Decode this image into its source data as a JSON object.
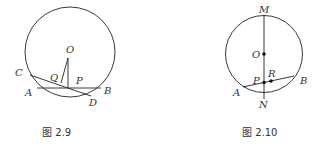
{
  "figures": [
    {
      "caption": "图 2.9",
      "labels": {
        "O": "O",
        "Q": "Q",
        "P": "P",
        "C": "C",
        "A": "A",
        "B": "B",
        "D": "D"
      }
    },
    {
      "caption": "图 2.10",
      "labels": {
        "M": "M",
        "O": "O",
        "P": "P",
        "R": "R",
        "A": "A",
        "B": "B",
        "N": "N"
      }
    }
  ],
  "colors": {
    "stroke": "#222222",
    "text": "#333333",
    "background": "#ffffff"
  }
}
